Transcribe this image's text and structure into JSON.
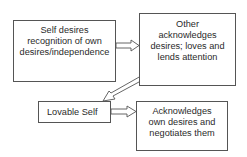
{
  "diagram": {
    "nodes": [
      {
        "id": "self-desires",
        "label": "Self desires\nrecognition of own\ndesires/independence"
      },
      {
        "id": "other-acknowledges",
        "label": "Other\nacknowledges\ndesires; loves and\nlends attention"
      },
      {
        "id": "lovable-self",
        "label": "Lovable Self"
      },
      {
        "id": "acknowledges-own",
        "label": "Acknowledges\nown desires and\nnegotiates them"
      }
    ],
    "edges": [
      {
        "from": "self-desires",
        "to": "other-acknowledges"
      },
      {
        "from": "other-acknowledges",
        "to": "lovable-self"
      },
      {
        "from": "lovable-self",
        "to": "acknowledges-own"
      }
    ]
  }
}
